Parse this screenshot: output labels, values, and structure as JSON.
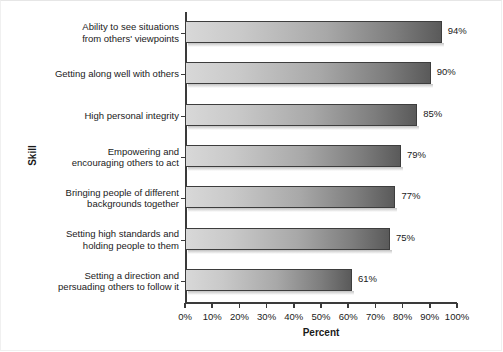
{
  "chart_data": {
    "type": "bar",
    "orientation": "horizontal",
    "title": "",
    "xlabel": "Percent",
    "ylabel": "Skill",
    "xlim": [
      0,
      100
    ],
    "grid": false,
    "legend": null,
    "xtick_labels": [
      "0%",
      "10%",
      "20%",
      "30%",
      "40%",
      "50%",
      "60%",
      "70%",
      "80%",
      "90%",
      "100%"
    ],
    "xtick_values": [
      0,
      10,
      20,
      30,
      40,
      50,
      60,
      70,
      80,
      90,
      100
    ],
    "categories": [
      "Ability to see situations from others' viewpoints",
      "Getting along well with others",
      "High personal integrity",
      "Empowering and encouraging others to act",
      "Bringing people of different backgrounds together",
      "Setting high standards and holding people to them",
      "Setting a direction and persuading others to follow it"
    ],
    "values": [
      94,
      90,
      85,
      79,
      77,
      75,
      61
    ],
    "data_labels": [
      "94%",
      "90%",
      "85%",
      "79%",
      "77%",
      "75%",
      "61%"
    ],
    "bars": [
      {
        "line1": "Ability to see situations",
        "line2": "from others' viewpoints",
        "value": 94,
        "label": "94%"
      },
      {
        "line1": "Getting along well with others",
        "line2": "",
        "value": 90,
        "label": "90%"
      },
      {
        "line1": "High personal integrity",
        "line2": "",
        "value": 85,
        "label": "85%"
      },
      {
        "line1": "Empowering and",
        "line2": "encouraging others to act",
        "value": 79,
        "label": "79%"
      },
      {
        "line1": "Bringing people of different",
        "line2": "backgrounds together",
        "value": 77,
        "label": "77%"
      },
      {
        "line1": "Setting high standards and",
        "line2": "holding people to them",
        "value": 75,
        "label": "75%"
      },
      {
        "line1": "Setting a direction and",
        "line2": "persuading others to follow it",
        "value": 61,
        "label": "61%"
      }
    ],
    "colors": {
      "bar_gradient_start": "#d8d8d8",
      "bar_gradient_end": "#5a5a5a",
      "bar_border": "#3d3d3d",
      "axis": "#3a3a3a",
      "text": "#1a1a1a",
      "background": "#ffffff"
    }
  }
}
